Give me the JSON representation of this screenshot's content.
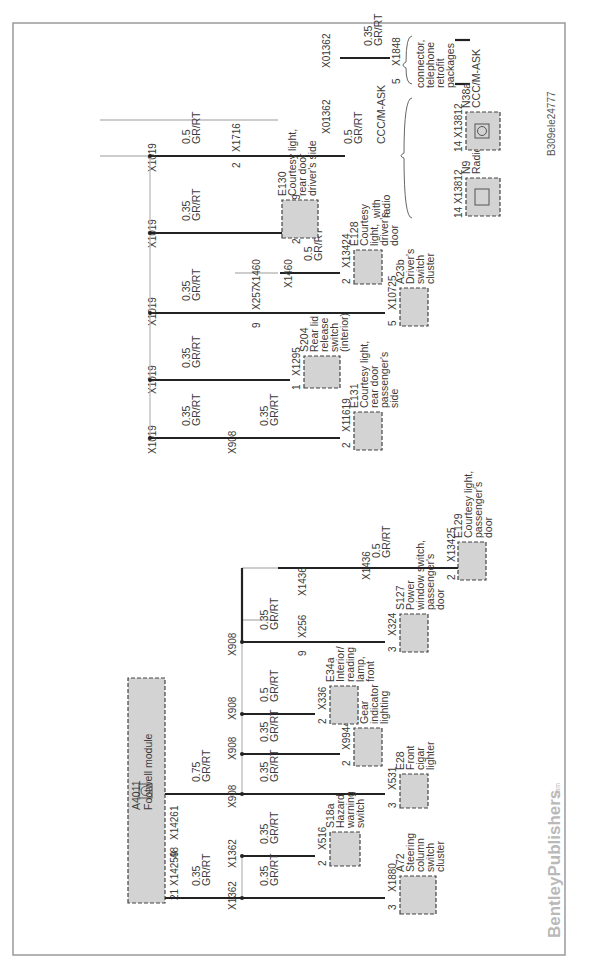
{
  "diagram": {
    "orientation": "rotated-90-ccw",
    "reference_code": "B309ele24777",
    "watermark": {
      "brand": "BentleyPublishers",
      "suffix": ".com"
    },
    "colors": {
      "wire": "#222222",
      "component_fill": "#d3d3d3",
      "component_border": "#444444",
      "frame": "#9a9a9a",
      "bus_line": "#bcbcbc"
    },
    "source_module": {
      "id": "A4011",
      "name": "Footwell module"
    },
    "source_connectors": [
      {
        "pin": "21",
        "connector": "X14259"
      },
      {
        "pin": "48",
        "connector": "X14261"
      }
    ],
    "source_wires": [
      {
        "gauge": "0.35",
        "color": "GR/RT"
      },
      {
        "gauge": "0.75",
        "color": "GR/RT"
      }
    ],
    "splices": [
      "X1362",
      "X1362",
      "X908",
      "X908",
      "X908",
      "X908",
      "X1436",
      "X1436",
      "X1019",
      "X1019",
      "X1019",
      "X1019",
      "X1460",
      "X1460",
      "X1019",
      "X01362",
      "X01362"
    ],
    "branches": [
      {
        "splice": "X1362",
        "gauge": "0.35",
        "color": "GR/RT",
        "pin": "3",
        "connector": "X1880",
        "component_id": "A72",
        "component_name": "Steering column switch cluster"
      },
      {
        "splice": "X1362",
        "gauge": "0.35",
        "color": "GR/RT",
        "pin": "2",
        "connector": "X516",
        "component_id": "S18a",
        "component_name": "Hazard warning switch"
      },
      {
        "splice": "X908",
        "gauge": "0.35",
        "color": "GR/RT",
        "pin": "3",
        "connector": "X531",
        "component_id": "E28",
        "component_name": "Front cigar lighter"
      },
      {
        "splice": "X908",
        "gauge": "0.35",
        "color": "GR/RT",
        "pin": "2",
        "connector": "X99441",
        "component_id": "E82",
        "component_name": "Gear indicator lighting"
      },
      {
        "splice": "X908",
        "gauge": "0.5",
        "color": "GR/RT",
        "pin": "2",
        "connector": "X336",
        "component_id": "E34a",
        "component_name": "Interior/ reading lamp, front"
      },
      {
        "splice": "X908",
        "gauge": "0.35",
        "color": "GR/RT",
        "pin": "9",
        "connector": "X256",
        "via_splice": "X1436",
        "end_pin": "3",
        "end_connector": "X324",
        "component_id": "S127",
        "component_name": "Power window switch, passenger's door"
      },
      {
        "splice": "X1436",
        "gauge": "0.5",
        "color": "GR/RT",
        "pin": "2",
        "connector": "X13425",
        "component_id": "E129",
        "component_name": "Courtesy light, passenger's door"
      },
      {
        "splice": "X1019",
        "gauge": "0.35",
        "color": "GR/RT",
        "via_splice": "X908",
        "gauge2": "0.35",
        "pin": "2",
        "connector": "X11619",
        "component_id": "E131",
        "component_name": "Courtesy light, rear door passenger's side"
      },
      {
        "splice": "X1019",
        "gauge": "0.35",
        "color": "GR/RT",
        "pin": "1",
        "connector": "X1295",
        "component_id": "S204",
        "component_name": "Rear lid release switch (interior)"
      },
      {
        "splice": "X1019",
        "gauge": "0.35",
        "color": "GR/RT",
        "pin": "9",
        "connector": "X257",
        "via_splice": "X1460",
        "end_pin": "5",
        "end_connector": "X10725",
        "component_id": "A23b",
        "component_name": "Driver's switch cluster"
      },
      {
        "splice": "X1460",
        "gauge": "0.5",
        "color": "GR/RT",
        "pin": "2",
        "connector": "X13424",
        "component_id": "E128",
        "component_name": "Courtesy light, driver's door"
      },
      {
        "splice": "X1019",
        "gauge": "0.35",
        "color": "GR/RT",
        "pin": "2",
        "connector": "X11609",
        "component_id": "E130",
        "component_name": "Courtesy light, rear door driver's side"
      },
      {
        "splice": "X1019",
        "gauge": "0.5",
        "color": "GR/RT",
        "pin": "2",
        "connector": "X1716",
        "via_splice": "X01362",
        "gauge2": "0.5",
        "option_label": "CCC/M-ASK",
        "option_label2": "with radio"
      },
      {
        "splice": "X01362",
        "gauge": "0.35",
        "color": "GR/RT",
        "pin": "5",
        "connector": "X1848",
        "note": "connector, telephone retrofit packages"
      }
    ],
    "radio_options": [
      {
        "pin": "14",
        "connector": "X13812",
        "component_id": "N9",
        "component_name": "Radio",
        "condition": "with radio"
      },
      {
        "pin": "14",
        "connector": "X13812",
        "component_id": "N38a",
        "component_name": "CCC/M-ASK",
        "condition": "CCC/M-ASK"
      }
    ]
  },
  "t": {
    "ref": "B309ele24777",
    "wm1": "BentleyPublishers",
    "wm2": ".com",
    "a4011": "A4011",
    "footwell": "Footwell module",
    "p21": "21",
    "x14259": "X14259",
    "p48": "48",
    "x14261": "X14261",
    "g035": "0.35",
    "g05": "0.5",
    "g075": "0.75",
    "grrt": "GR/RT",
    "x1362": "X1362",
    "x908": "X908",
    "x1436": "X1436",
    "x1019": "X1019",
    "x1460": "X1460",
    "x01362": "X01362",
    "p1": "1",
    "p2": "2",
    "p3": "3",
    "p5": "5",
    "p9": "9",
    "p14": "14",
    "x1880": "X1880",
    "x516": "X516",
    "x531": "X531",
    "x99441": "X99441",
    "x336": "X336",
    "x256": "X256",
    "x324": "X324",
    "x13425": "X13425",
    "x11619": "X11619",
    "x1295": "X1295",
    "x257": "X257",
    "x10725": "X10725",
    "x13424": "X13424",
    "x11609": "X11609",
    "x1716": "X1716",
    "x1848": "X1848",
    "x13812": "X13812",
    "a72": [
      "A72",
      "Steering",
      "column",
      "switch",
      "cluster"
    ],
    "s18a": [
      "S18a",
      "Hazard",
      "warning",
      "switch"
    ],
    "e28": [
      "E28",
      "Front",
      "cigar",
      "lighter"
    ],
    "e82": [
      "E82",
      "Gear",
      "indicator",
      "lighting"
    ],
    "e34a": [
      "E34a",
      "Interior/",
      "reading",
      "lamp,",
      "front"
    ],
    "s127": [
      "S127",
      "Power",
      "window switch,",
      "passenger's",
      "door"
    ],
    "e129": [
      "E129",
      "Courtesy light,",
      "passenger's",
      "door"
    ],
    "e131": [
      "E131",
      "Courtesy light,",
      "rear door",
      "passenger's",
      "side"
    ],
    "s204": [
      "S204",
      "Rear lid",
      "release",
      "switch",
      "(interior)"
    ],
    "a23b": [
      "A23b",
      "Driver's",
      "switch",
      "cluster"
    ],
    "e128": [
      "E128",
      "Courtesy",
      "light,",
      "driver's",
      "door"
    ],
    "e130": [
      "E130",
      "Courtesy light,",
      "rear door",
      "driver's side"
    ],
    "ccc": "CCC/M-ASK",
    "withradio": [
      "with",
      "radio"
    ],
    "n9": [
      "N9",
      "Radio"
    ],
    "n38a": [
      "N38a",
      "CCC/M-ASK"
    ],
    "tel": [
      "connector,",
      "telephone",
      "retrofit",
      "packages"
    ]
  }
}
